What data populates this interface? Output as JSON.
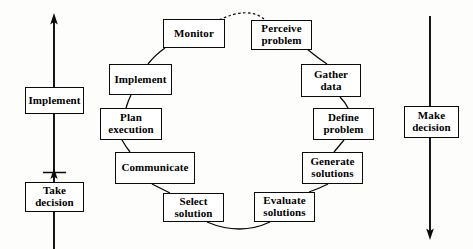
{
  "diagram": {
    "type": "cycle-flow-diagram",
    "background_color": "#fdfdfc",
    "line_color": "#0a0a0a",
    "box_fill": "#ffffff",
    "text_color": "#000000",
    "cycle_nodes": [
      {
        "id": "monitor",
        "label": "Monitor",
        "x": 163,
        "y": 19,
        "w": 62,
        "h": 29
      },
      {
        "id": "perceive-problem",
        "label": "Perceive\nproblem",
        "x": 251,
        "y": 20,
        "w": 61,
        "h": 30
      },
      {
        "id": "gather-data",
        "label": "Gather\ndata",
        "x": 301,
        "y": 64,
        "w": 60,
        "h": 33
      },
      {
        "id": "define-problem",
        "label": "Define\nproblem",
        "x": 313,
        "y": 108,
        "w": 61,
        "h": 32
      },
      {
        "id": "generate-solutions",
        "label": "Generate\nsolutions",
        "x": 302,
        "y": 152,
        "w": 61,
        "h": 32
      },
      {
        "id": "evaluate-solutions",
        "label": "Evaluate\nsolutions",
        "x": 254,
        "y": 192,
        "w": 61,
        "h": 30
      },
      {
        "id": "select-solution",
        "label": "Select\nsolution",
        "x": 163,
        "y": 193,
        "w": 61,
        "h": 29
      },
      {
        "id": "communicate",
        "label": "Communicate",
        "x": 115,
        "y": 152,
        "w": 80,
        "h": 32
      },
      {
        "id": "plan-execution",
        "label": "Plan\nexecution",
        "x": 100,
        "y": 108,
        "w": 62,
        "h": 32
      },
      {
        "id": "implement-cycle",
        "label": "Implement",
        "x": 109,
        "y": 64,
        "w": 63,
        "h": 31
      }
    ],
    "rail_nodes": [
      {
        "id": "implement-rail",
        "label": "Implement",
        "x": 25,
        "y": 87,
        "w": 59,
        "h": 27
      },
      {
        "id": "take-decision",
        "label": "Take\ndecision",
        "x": 25,
        "y": 182,
        "w": 59,
        "h": 30
      },
      {
        "id": "make-decision",
        "label": "Make\ndecision",
        "x": 404,
        "y": 106,
        "w": 55,
        "h": 32
      }
    ],
    "rails": [
      {
        "id": "left-rail",
        "semantic": "implementation-flow-upward",
        "direction": "up",
        "x": 54,
        "top_y": 17,
        "bottom_y": 249,
        "arrow": "up-arrowhead-at-top",
        "has_mid_arrowhead": true,
        "mid_arrowhead_y": 176,
        "tick_y": 172
      },
      {
        "id": "right-rail",
        "semantic": "decision-flow-downward",
        "direction": "down",
        "x": 430,
        "top_y": 17,
        "bottom_y": 236,
        "arrow": "down-arrowhead-at-bottom",
        "has_mid_arrowhead": false
      }
    ],
    "connectors": [
      {
        "id": "monitor-to-perceive",
        "style": "dashed",
        "from": "monitor",
        "to": "perceive-problem"
      },
      {
        "id": "perceive-to-gather",
        "style": "solid",
        "from": "perceive-problem",
        "to": "gather-data"
      },
      {
        "id": "gather-to-define",
        "style": "solid",
        "from": "gather-data",
        "to": "define-problem"
      },
      {
        "id": "define-to-generate",
        "style": "solid",
        "from": "define-problem",
        "to": "generate-solutions"
      },
      {
        "id": "generate-to-evaluate",
        "style": "solid",
        "from": "generate-solutions",
        "to": "evaluate-solutions"
      },
      {
        "id": "evaluate-to-select",
        "style": "solid",
        "from": "evaluate-solutions",
        "to": "select-solution"
      },
      {
        "id": "select-to-communicate",
        "style": "solid",
        "from": "select-solution",
        "to": "communicate"
      },
      {
        "id": "communicate-to-plan",
        "style": "solid",
        "from": "communicate",
        "to": "plan-execution"
      },
      {
        "id": "plan-to-implement",
        "style": "solid",
        "from": "plan-execution",
        "to": "implement-cycle"
      },
      {
        "id": "implement-to-monitor",
        "style": "solid",
        "from": "implement-cycle",
        "to": "monitor"
      }
    ]
  }
}
